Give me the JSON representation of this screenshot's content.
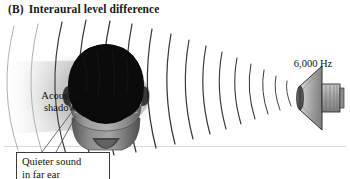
{
  "figure": {
    "panel_letter": "(B)",
    "title": "Interaural level difference",
    "background_color": "#ffffff"
  },
  "labels": {
    "acoustic_shadow": "Acoustic\nshadow",
    "acoustic_shadow_line1": "Acoustic",
    "acoustic_shadow_line2": "shadow",
    "frequency": "6,000 Hz",
    "callout_line1": "Quieter sound",
    "callout_line2": "in far ear"
  },
  "elements": {
    "head_icon": "head-rear-view",
    "speaker_icon": "loudspeaker-horn",
    "wavefront_icon": "sound-wave-arcs",
    "shadow_icon": "acoustic-shadow-cone",
    "ground_icon": "ground-line"
  },
  "colors": {
    "hair": "#0d0d0d",
    "neck": "#8f8f8f",
    "shadow": "#b9b9b9",
    "wave_stroke": "#3a3a3a",
    "wave_stroke_faint": "#bdbdbd",
    "speaker_body": "#9a9a9a",
    "outline": "#2b2b2b",
    "text": "#111111",
    "callout_border": "#3b3b3b"
  },
  "diagram_data": {
    "type": "illustration",
    "concept": "Interaural level difference",
    "stimulus_frequency_hz": 6000,
    "stimulus_frequency_label": "6,000 Hz",
    "source_position": "right",
    "listener_orientation": "rear-view",
    "annotations": [
      "Acoustic shadow",
      "Quieter sound in far ear",
      "6,000 Hz"
    ],
    "wavefront_count": 14,
    "shadow_side": "left"
  }
}
